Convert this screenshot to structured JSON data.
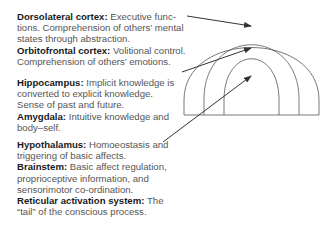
{
  "diagram": {
    "type": "layered-arch",
    "layers": [
      "outer",
      "middle",
      "inner"
    ]
  },
  "annotations": [
    {
      "entries": [
        {
          "term": "Dorsolateral cortex:",
          "text": " Executive func-tions. Comprehension of others’ mental states through abstraction."
        },
        {
          "term": "Orbitofrontal cortex:",
          "text": " Volitional control. Comprehension of others’ emotions."
        }
      ],
      "points_to": "outer"
    },
    {
      "entries": [
        {
          "term": "Hippocampus:",
          "text": " Implicit knowledge is converted to explicit knowledge. Sense of past and future."
        },
        {
          "term": "Amygdala:",
          "text": " Intuitive knowledge and body–self."
        }
      ],
      "points_to": "middle"
    },
    {
      "entries": [
        {
          "term": "Hypothalamus:",
          "text": " Homoeostasis and triggering of basic affects."
        },
        {
          "term": "Brainstem:",
          "text": " Basic affect regulation, proprioceptive information, and sensorimotor co-ordination."
        },
        {
          "term": "Reticular activation system:",
          "text": " The “tail” of the conscious process."
        }
      ],
      "points_to": "inner"
    }
  ],
  "colors": {
    "line": "#444444",
    "term": "#1a1a1a",
    "body": "#555555"
  }
}
